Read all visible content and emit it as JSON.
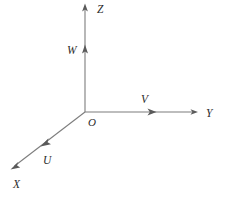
{
  "figure": {
    "background_color": "#ffffff",
    "line_color": "#7d7d7d",
    "arrow_color": "#5a5a5a",
    "label_color": "#2b2b2b",
    "width": 225,
    "height": 199
  },
  "origin": {
    "label": "O",
    "x": 85,
    "y": 112,
    "label_x": 88,
    "label_y": 126
  },
  "axes": [
    {
      "id": "z-axis",
      "label": "Z",
      "label_x": 97,
      "label_y": 13,
      "start_x": 85,
      "start_y": 112,
      "end_x": 85,
      "end_y": 5,
      "direction": "up"
    },
    {
      "id": "y-axis",
      "label": "Y",
      "label_x": 206,
      "label_y": 117,
      "start_x": 85,
      "start_y": 112,
      "end_x": 197,
      "end_y": 112,
      "direction": "right"
    },
    {
      "id": "x-axis",
      "label": "X",
      "label_x": 13,
      "label_y": 188,
      "start_x": 85,
      "start_y": 112,
      "end_x": 12,
      "end_y": 168,
      "direction": "down-left"
    }
  ],
  "vectors": [
    {
      "id": "w-vector",
      "label": "W",
      "label_x": 67,
      "label_y": 54,
      "tip_x": 85,
      "tip_y": 46,
      "on_axis": "z-axis",
      "direction": "up"
    },
    {
      "id": "v-vector",
      "label": "V",
      "label_x": 141,
      "label_y": 103,
      "tip_x": 155,
      "tip_y": 112,
      "on_axis": "y-axis",
      "direction": "right"
    },
    {
      "id": "u-vector",
      "label": "U",
      "label_x": 43,
      "label_y": 164,
      "tip_x": 43,
      "tip_y": 145,
      "on_axis": "x-axis",
      "direction": "down-left"
    }
  ]
}
